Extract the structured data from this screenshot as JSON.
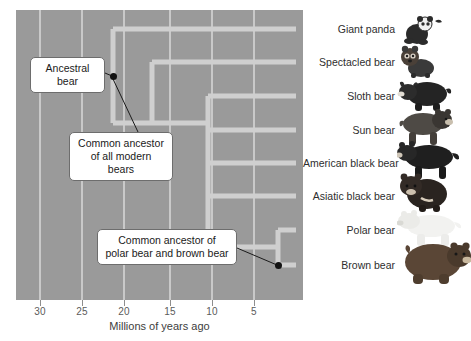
{
  "figure": {
    "kind": "phylogenetic-tree",
    "axis": {
      "title": "Millions of years ago",
      "ticks": [
        {
          "value": "30",
          "x": 40
        },
        {
          "value": "25",
          "x": 82
        },
        {
          "value": "20",
          "x": 124
        },
        {
          "value": "15",
          "x": 170
        },
        {
          "value": "10",
          "x": 212
        },
        {
          "value": "5",
          "x": 254
        }
      ],
      "direction": "right-to-left",
      "pixels_per_myr": 8.4,
      "present_x": 296
    },
    "panel": {
      "left": 16,
      "top": 10,
      "width": 287,
      "height": 290,
      "background": "#9a9a9a",
      "gridline_color": "#c9c9c9",
      "gridlines_x": [
        40,
        82,
        124,
        170,
        212,
        254
      ]
    },
    "branch_color": "#cfcfcf"
  },
  "taxa": [
    {
      "label": "Giant panda",
      "icon": "giant-panda-icon",
      "y": 29,
      "divergence_mya": 22
    },
    {
      "label": "Spectacled bear",
      "icon": "spectacled-bear-icon",
      "y": 62,
      "divergence_mya": 13
    },
    {
      "label": "Sloth bear",
      "icon": "sloth-bear-icon",
      "y": 96,
      "divergence_mya": 10
    },
    {
      "label": "Sun bear",
      "icon": "sun-bear-icon",
      "y": 130,
      "divergence_mya": 9
    },
    {
      "label": "American black bear",
      "icon": "american-black-bear-icon",
      "y": 163,
      "divergence_mya": 7
    },
    {
      "label": "Asiatic black bear",
      "icon": "asiatic-black-bear-icon",
      "y": 196,
      "divergence_mya": 6
    },
    {
      "label": "Polar bear",
      "icon": "polar-bear-icon",
      "y": 230,
      "divergence_mya": 3
    },
    {
      "label": "Brown bear",
      "icon": "brown-bear-icon",
      "y": 265,
      "divergence_mya": 3
    }
  ],
  "nodes": [
    {
      "name": "root-node",
      "x": 113,
      "y": 76,
      "mya": 22,
      "dot": true
    },
    {
      "name": "modern-bears-node",
      "x": 113,
      "y": 76,
      "mya": 22,
      "dot": false
    },
    {
      "name": "ursinae-node",
      "x": 208,
      "y": 129,
      "mya": 11,
      "dot": false
    },
    {
      "name": "polar-brown-node",
      "x": 278,
      "y": 247,
      "mya": 3,
      "dot": true
    }
  ],
  "callouts": [
    {
      "name": "ancestral-bear-callout",
      "text": "Ancestral\nbear",
      "left": 30,
      "top": 57,
      "width": 75,
      "height": 32,
      "leader_to_x": 112,
      "leader_to_y": 76
    },
    {
      "name": "common-ancestor-modern-bears-callout",
      "text": "Common ancestor\nof all modern bears",
      "left": 69,
      "top": 132,
      "width": 104,
      "height": 32,
      "leader_to_x": 112,
      "leader_to_y": 78
    },
    {
      "name": "common-ancestor-polar-brown-callout",
      "text": "Common ancestor of\npolar bear and brown bear",
      "left": 97,
      "top": 229,
      "width": 140,
      "height": 32,
      "leader_to_x": 277,
      "leader_to_y": 265
    }
  ]
}
